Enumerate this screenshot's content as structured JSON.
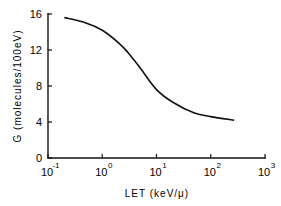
{
  "chart_data": {
    "type": "line",
    "title": "",
    "xlabel": "LET (keV/μ)",
    "ylabel": "G (molecules/100eV)",
    "xscale": "log",
    "xlim": [
      0.1,
      1000
    ],
    "ylim": [
      0,
      16
    ],
    "grid": false,
    "legend": null,
    "x_ticks": [
      {
        "base": "10",
        "exp": "-1",
        "value": 0.1
      },
      {
        "base": "10",
        "exp": "0",
        "value": 1
      },
      {
        "base": "10",
        "exp": "1",
        "value": 10
      },
      {
        "base": "10",
        "exp": "2",
        "value": 100
      },
      {
        "base": "10",
        "exp": "3",
        "value": 1000
      }
    ],
    "y_ticks": [
      "0",
      "4",
      "8",
      "12",
      "16"
    ],
    "series": [
      {
        "name": "G",
        "x": [
          0.2,
          0.5,
          1,
          2,
          3,
          5,
          10,
          20,
          50,
          100,
          270
        ],
        "y": [
          15.6,
          15.0,
          14.2,
          12.8,
          11.7,
          10.0,
          7.6,
          6.2,
          5.0,
          4.6,
          4.2
        ]
      }
    ]
  }
}
